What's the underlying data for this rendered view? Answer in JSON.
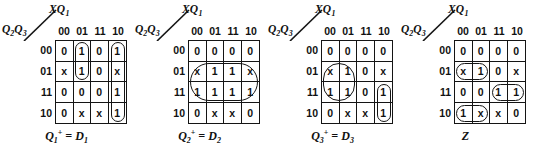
{
  "figure": {
    "map_count": 4,
    "col_var_label_main": "XQ",
    "col_var_label_sub": "1",
    "row_var_label_main_a": "Q",
    "row_var_label_sub_a": "2",
    "row_var_label_main_b": "Q",
    "row_var_label_sub_b": "3",
    "col_headers": [
      "00",
      "01",
      "11",
      "10"
    ],
    "row_headers": [
      "00",
      "01",
      "11",
      "10"
    ],
    "ink_color": "#141414",
    "background_color": "#ffffff"
  },
  "maps": [
    {
      "id": "map-q1",
      "caption_main": "Q",
      "caption_sub": "1",
      "caption_sup": "+",
      "caption_rhs": "= D",
      "caption_rhs_sub": "1",
      "caption_text": "Q1+ = D1",
      "cells": [
        [
          "0",
          "1",
          "0",
          "1"
        ],
        [
          "x",
          "1",
          "0",
          "x"
        ],
        [
          "0",
          "0",
          "0",
          "1"
        ],
        [
          "0",
          "x",
          "x",
          "1"
        ]
      ],
      "groups": [
        {
          "name": "group-col01-rows00-01",
          "col": 1,
          "row": 0,
          "cols_span": 1,
          "rows_span": 2
        },
        {
          "name": "group-col10-rows-all",
          "col": 3,
          "row": 0,
          "cols_span": 1,
          "rows_span": 4
        }
      ]
    },
    {
      "id": "map-q2",
      "caption_main": "Q",
      "caption_sub": "2",
      "caption_sup": "+",
      "caption_rhs": "= D",
      "caption_rhs_sub": "2",
      "caption_text": "Q2+ = D2",
      "cells": [
        [
          "0",
          "0",
          "0",
          "0"
        ],
        [
          "x",
          "1",
          "1",
          "x"
        ],
        [
          "1",
          "1",
          "1",
          "1"
        ],
        [
          "0",
          "x",
          "x",
          "0"
        ]
      ],
      "groups": [
        {
          "name": "group-rows01-11-all-cols",
          "col": 0,
          "row": 1,
          "cols_span": 4,
          "rows_span": 2
        }
      ]
    },
    {
      "id": "map-q3",
      "caption_main": "Q",
      "caption_sub": "3",
      "caption_sup": "+",
      "caption_rhs": "= D",
      "caption_rhs_sub": "3",
      "caption_text": "Q3+ = D3",
      "cells": [
        [
          "0",
          "0",
          "0",
          "0"
        ],
        [
          "x",
          "1",
          "0",
          "x"
        ],
        [
          "1",
          "1",
          "0",
          "1"
        ],
        [
          "0",
          "x",
          "x",
          "1"
        ]
      ],
      "groups": [
        {
          "name": "group-cols00-01-rows01-11",
          "col": 0,
          "row": 1,
          "cols_span": 2,
          "rows_span": 2
        },
        {
          "name": "group-col10-rows11-10",
          "col": 3,
          "row": 2,
          "cols_span": 1,
          "rows_span": 2
        }
      ]
    },
    {
      "id": "map-z",
      "caption_main": "Z",
      "caption_sub": "",
      "caption_sup": "",
      "caption_rhs": "",
      "caption_rhs_sub": "",
      "caption_text": "Z",
      "cells": [
        [
          "0",
          "0",
          "0",
          "0"
        ],
        [
          "x",
          "1",
          "0",
          "x"
        ],
        [
          "0",
          "0",
          "1",
          "1"
        ],
        [
          "1",
          "x",
          "x",
          "0"
        ]
      ],
      "groups": [
        {
          "name": "group-row01-cols00-01",
          "col": 0,
          "row": 1,
          "cols_span": 2,
          "rows_span": 1
        },
        {
          "name": "group-row11-cols11-10",
          "col": 2,
          "row": 2,
          "cols_span": 2,
          "rows_span": 1
        },
        {
          "name": "group-row10-cols00-01",
          "col": 0,
          "row": 3,
          "cols_span": 2,
          "rows_span": 1
        }
      ]
    }
  ]
}
